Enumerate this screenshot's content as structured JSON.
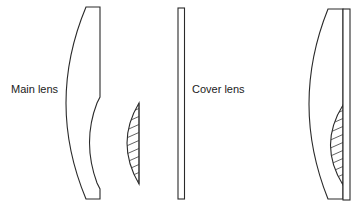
{
  "figure": {
    "labels": {
      "main_lens": "Main lens",
      "cover_lens": "Cover lens"
    },
    "components": [
      {
        "id": "main-lens",
        "description": "Main lens: convex front, partially concave back surface"
      },
      {
        "id": "corrector-element",
        "description": "Small hatched plano-convex element"
      },
      {
        "id": "cover-lens",
        "description": "Flat cover plate"
      },
      {
        "id": "assembled-lens",
        "description": "Assembled lens: main lens with cemented hatched element and cover plate"
      }
    ],
    "colors": {
      "stroke": "#2a2a2a",
      "background": "#ffffff"
    }
  }
}
